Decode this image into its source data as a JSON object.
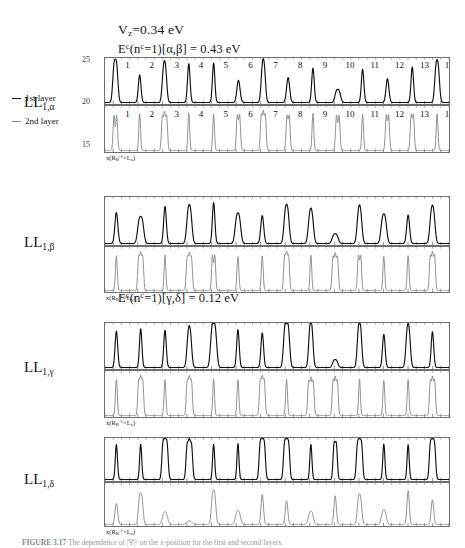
{
  "annotations": {
    "vz": "V_z=0.34 eV",
    "vz_parts": {
      "v": "V",
      "sub": "z",
      "rest": "=0.34 eV"
    },
    "e_alpha_beta": "E^c(n^c=1)[α,β] = 0.43 eV",
    "e_gamma_delta": "E^c(n^c=1)[γ,δ] = 0.12 eV",
    "e_ab_parts": {
      "E": "E",
      "Esup": "c",
      "mid": "(n",
      "nsup": "c",
      "tail": "=1)[α,β] = 0.43 eV"
    },
    "e_gd_parts": {
      "E": "E",
      "Esup": "c",
      "mid": "(n",
      "nsup": "c",
      "tail": "=1)[γ,δ] = 0.12 eV"
    }
  },
  "legend": {
    "first_layer": "1st layer",
    "second_layer": "2nd layer",
    "first_layer_color": "#111111",
    "second_layer_color": "#8d8d8d"
  },
  "outer_axis": {
    "label_top": "25",
    "label_mid": "20",
    "label_bottom": "15"
  },
  "axis_titles": {
    "y": "|ψ|²",
    "y_parts": {
      "base": "|ψ|",
      "sup": "2"
    },
    "x": "x(Rв⁻¹×L₂)",
    "x_parts": {
      "a": "x(R",
      "asub": "B",
      "asup": "-1",
      "b": "×L",
      "bsub": "z",
      "c": ")"
    }
  },
  "groups": [
    {
      "id": "LL1alpha",
      "label": "LL",
      "label_sub": "1,α",
      "top": {
        "layer": "1st layer",
        "color": "#111111",
        "yticks": [
          "0.01",
          "0"
        ],
        "ymax": 0.0155,
        "peak_numbers": [
          "1",
          "2",
          "3",
          "4",
          "5",
          "6",
          "7",
          "8",
          "9",
          "10",
          "11",
          "12",
          "13",
          "14"
        ],
        "peaks": [
          {
            "c": 2.0,
            "h": 0.0128,
            "w": 0.62,
            "split": 2,
            "gap": 0.5
          },
          {
            "c": 6.7,
            "h": 0.01,
            "w": 0.6,
            "split": 1,
            "gap": 0.0
          },
          {
            "c": 11.5,
            "h": 0.0108,
            "w": 0.62,
            "split": 2,
            "gap": 0.42
          },
          {
            "c": 16.2,
            "h": 0.014,
            "w": 0.58,
            "split": 1,
            "gap": 0.0
          },
          {
            "c": 21.0,
            "h": 0.0142,
            "w": 0.56,
            "split": 1,
            "gap": 0.0
          },
          {
            "c": 25.8,
            "h": 0.008,
            "w": 0.72,
            "split": 1,
            "gap": 0.0
          },
          {
            "c": 30.6,
            "h": 0.0112,
            "w": 0.6,
            "split": 2,
            "gap": 0.4
          },
          {
            "c": 35.4,
            "h": 0.009,
            "w": 0.7,
            "split": 1,
            "gap": 0.0
          },
          {
            "c": 40.2,
            "h": 0.0124,
            "w": 0.58,
            "split": 1,
            "gap": 0.0
          },
          {
            "c": 45.0,
            "h": 0.0038,
            "w": 0.7,
            "split": 2,
            "gap": 0.55
          },
          {
            "c": 49.8,
            "h": 0.012,
            "w": 0.58,
            "split": 1,
            "gap": 0.0
          },
          {
            "c": 54.6,
            "h": 0.0086,
            "w": 0.66,
            "split": 1,
            "gap": 0.0
          },
          {
            "c": 59.4,
            "h": 0.0128,
            "w": 0.58,
            "split": 1,
            "gap": 0.0
          },
          {
            "c": 64.2,
            "h": 0.0116,
            "w": 0.62,
            "split": 2,
            "gap": 0.45
          }
        ]
      },
      "bottom": {
        "layer": "2nd layer",
        "color": "#8d8d8d",
        "yticks": [
          "0.1",
          "0"
        ],
        "ymax": 0.125,
        "peak_numbers": [
          "1",
          "2",
          "3",
          "4",
          "5",
          "6",
          "7",
          "8",
          "9",
          "10",
          "11",
          "12",
          "13",
          "14"
        ],
        "peaks": [
          {
            "c": 2.0,
            "h": 0.105,
            "w": 0.42,
            "split": 2,
            "gap": 0.52
          },
          {
            "c": 6.7,
            "h": 0.108,
            "w": 0.4,
            "split": 1,
            "gap": 0.0
          },
          {
            "c": 11.5,
            "h": 0.103,
            "w": 0.42,
            "split": 3,
            "gap": 0.42
          },
          {
            "c": 16.2,
            "h": 0.11,
            "w": 0.4,
            "split": 1,
            "gap": 0.0
          },
          {
            "c": 21.0,
            "h": 0.107,
            "w": 0.4,
            "split": 1,
            "gap": 0.0
          },
          {
            "c": 25.8,
            "h": 0.104,
            "w": 0.42,
            "split": 2,
            "gap": 0.45
          },
          {
            "c": 30.6,
            "h": 0.106,
            "w": 0.4,
            "split": 3,
            "gap": 0.4
          },
          {
            "c": 35.4,
            "h": 0.102,
            "w": 0.42,
            "split": 2,
            "gap": 0.44
          },
          {
            "c": 40.2,
            "h": 0.108,
            "w": 0.4,
            "split": 1,
            "gap": 0.0
          },
          {
            "c": 45.0,
            "h": 0.103,
            "w": 0.44,
            "split": 2,
            "gap": 0.5
          },
          {
            "c": 49.8,
            "h": 0.106,
            "w": 0.4,
            "split": 1,
            "gap": 0.0
          },
          {
            "c": 54.6,
            "h": 0.104,
            "w": 0.42,
            "split": 2,
            "gap": 0.46
          },
          {
            "c": 59.4,
            "h": 0.105,
            "w": 0.42,
            "split": 2,
            "gap": 0.44
          },
          {
            "c": 64.2,
            "h": 0.107,
            "w": 0.4,
            "split": 1,
            "gap": 0.0
          }
        ]
      }
    },
    {
      "id": "LL1beta",
      "label": "LL",
      "label_sub": "1,β",
      "top": {
        "layer": "1st layer",
        "color": "#111111",
        "yticks": [
          "0.02",
          "0.01",
          "0"
        ],
        "ymax": 0.0215,
        "peak_numbers": [],
        "peaks": [
          {
            "c": 2.2,
            "h": 0.0148,
            "w": 0.68,
            "split": 1,
            "gap": 0.0
          },
          {
            "c": 6.9,
            "h": 0.0104,
            "w": 0.76,
            "split": 2,
            "gap": 0.6
          },
          {
            "c": 11.6,
            "h": 0.0178,
            "w": 0.62,
            "split": 1,
            "gap": 0.0
          },
          {
            "c": 16.3,
            "h": 0.0138,
            "w": 0.7,
            "split": 2,
            "gap": 0.5
          },
          {
            "c": 21.0,
            "h": 0.0196,
            "w": 0.58,
            "split": 1,
            "gap": 0.0
          },
          {
            "c": 25.7,
            "h": 0.0112,
            "w": 0.74,
            "split": 2,
            "gap": 0.55
          },
          {
            "c": 30.4,
            "h": 0.0134,
            "w": 0.68,
            "split": 1,
            "gap": 0.0
          },
          {
            "c": 35.1,
            "h": 0.0142,
            "w": 0.68,
            "split": 2,
            "gap": 0.5
          },
          {
            "c": 39.8,
            "h": 0.012,
            "w": 0.72,
            "split": 2,
            "gap": 0.48
          },
          {
            "c": 44.5,
            "h": 0.0036,
            "w": 0.8,
            "split": 2,
            "gap": 0.6
          },
          {
            "c": 49.2,
            "h": 0.013,
            "w": 0.68,
            "split": 2,
            "gap": 0.45
          },
          {
            "c": 53.9,
            "h": 0.0108,
            "w": 0.74,
            "split": 2,
            "gap": 0.55
          },
          {
            "c": 58.6,
            "h": 0.0136,
            "w": 0.66,
            "split": 1,
            "gap": 0.0
          },
          {
            "c": 63.3,
            "h": 0.0132,
            "w": 0.7,
            "split": 2,
            "gap": 0.48
          }
        ]
      },
      "bottom": {
        "layer": "2nd layer",
        "color": "#8d8d8d",
        "yticks": [
          "0.1",
          "0"
        ],
        "ymax": 0.125,
        "peak_numbers": [],
        "peaks": [
          {
            "c": 2.2,
            "h": 0.104,
            "w": 0.42,
            "split": 1,
            "gap": 0.0
          },
          {
            "c": 6.9,
            "h": 0.102,
            "w": 0.42,
            "split": 3,
            "gap": 0.4
          },
          {
            "c": 11.6,
            "h": 0.105,
            "w": 0.4,
            "split": 1,
            "gap": 0.0
          },
          {
            "c": 16.3,
            "h": 0.1,
            "w": 0.44,
            "split": 3,
            "gap": 0.42
          },
          {
            "c": 21.0,
            "h": 0.107,
            "w": 0.4,
            "split": 2,
            "gap": 0.46
          },
          {
            "c": 25.7,
            "h": 0.101,
            "w": 0.44,
            "split": 1,
            "gap": 0.0
          },
          {
            "c": 30.4,
            "h": 0.104,
            "w": 0.42,
            "split": 1,
            "gap": 0.0
          },
          {
            "c": 35.1,
            "h": 0.103,
            "w": 0.42,
            "split": 3,
            "gap": 0.4
          },
          {
            "c": 39.8,
            "h": 0.106,
            "w": 0.4,
            "split": 1,
            "gap": 0.0
          },
          {
            "c": 44.5,
            "h": 0.102,
            "w": 0.44,
            "split": 3,
            "gap": 0.44
          },
          {
            "c": 49.2,
            "h": 0.105,
            "w": 0.42,
            "split": 2,
            "gap": 0.45
          },
          {
            "c": 53.9,
            "h": 0.103,
            "w": 0.42,
            "split": 1,
            "gap": 0.0
          },
          {
            "c": 58.6,
            "h": 0.104,
            "w": 0.42,
            "split": 1,
            "gap": 0.0
          },
          {
            "c": 63.3,
            "h": 0.106,
            "w": 0.42,
            "split": 3,
            "gap": 0.42
          }
        ]
      }
    },
    {
      "id": "LL1gamma",
      "label": "LL",
      "label_sub": "1,γ",
      "top": {
        "layer": "1st layer",
        "color": "#111111",
        "yticks": [
          "0.01",
          "0"
        ],
        "ymax": 0.0168,
        "peak_numbers": [],
        "peaks": [
          {
            "c": 2.2,
            "h": 0.0142,
            "w": 0.6,
            "split": 1,
            "gap": 0.0
          },
          {
            "c": 6.9,
            "h": 0.0152,
            "w": 0.56,
            "split": 1,
            "gap": 0.0
          },
          {
            "c": 11.6,
            "h": 0.0146,
            "w": 0.58,
            "split": 1,
            "gap": 0.0
          },
          {
            "c": 16.3,
            "h": 0.0118,
            "w": 0.64,
            "split": 2,
            "gap": 0.44
          },
          {
            "c": 21.0,
            "h": 0.0112,
            "w": 0.66,
            "split": 3,
            "gap": 0.4
          },
          {
            "c": 25.7,
            "h": 0.0148,
            "w": 0.58,
            "split": 1,
            "gap": 0.0
          },
          {
            "c": 30.4,
            "h": 0.0136,
            "w": 0.6,
            "split": 1,
            "gap": 0.0
          },
          {
            "c": 35.1,
            "h": 0.0122,
            "w": 0.62,
            "split": 3,
            "gap": 0.4
          },
          {
            "c": 39.8,
            "h": 0.0134,
            "w": 0.6,
            "split": 2,
            "gap": 0.42
          },
          {
            "c": 44.5,
            "h": 0.0024,
            "w": 0.7,
            "split": 2,
            "gap": 0.52
          },
          {
            "c": 49.2,
            "h": 0.0136,
            "w": 0.6,
            "split": 2,
            "gap": 0.44
          },
          {
            "c": 53.9,
            "h": 0.013,
            "w": 0.6,
            "split": 1,
            "gap": 0.0
          },
          {
            "c": 58.6,
            "h": 0.0124,
            "w": 0.62,
            "split": 2,
            "gap": 0.42
          },
          {
            "c": 63.3,
            "h": 0.014,
            "w": 0.58,
            "split": 1,
            "gap": 0.0
          }
        ]
      },
      "bottom": {
        "layer": "2nd layer",
        "color": "#8d8d8d",
        "yticks": [
          "0.1",
          "0"
        ],
        "ymax": 0.125,
        "peak_numbers": [],
        "peaks": [
          {
            "c": 2.2,
            "h": 0.105,
            "w": 0.42,
            "split": 1,
            "gap": 0.0
          },
          {
            "c": 6.9,
            "h": 0.103,
            "w": 0.42,
            "split": 3,
            "gap": 0.4
          },
          {
            "c": 11.6,
            "h": 0.104,
            "w": 0.42,
            "split": 1,
            "gap": 0.0
          },
          {
            "c": 16.3,
            "h": 0.102,
            "w": 0.44,
            "split": 3,
            "gap": 0.42
          },
          {
            "c": 21.0,
            "h": 0.106,
            "w": 0.4,
            "split": 1,
            "gap": 0.0
          },
          {
            "c": 25.7,
            "h": 0.104,
            "w": 0.42,
            "split": 1,
            "gap": 0.0
          },
          {
            "c": 30.4,
            "h": 0.103,
            "w": 0.42,
            "split": 3,
            "gap": 0.4
          },
          {
            "c": 35.1,
            "h": 0.105,
            "w": 0.42,
            "split": 1,
            "gap": 0.0
          },
          {
            "c": 39.8,
            "h": 0.102,
            "w": 0.44,
            "split": 3,
            "gap": 0.44
          },
          {
            "c": 44.5,
            "h": 0.104,
            "w": 0.42,
            "split": 3,
            "gap": 0.42
          },
          {
            "c": 49.2,
            "h": 0.106,
            "w": 0.4,
            "split": 1,
            "gap": 0.0
          },
          {
            "c": 53.9,
            "h": 0.103,
            "w": 0.42,
            "split": 1,
            "gap": 0.0
          },
          {
            "c": 58.6,
            "h": 0.105,
            "w": 0.42,
            "split": 1,
            "gap": 0.0
          },
          {
            "c": 63.3,
            "h": 0.104,
            "w": 0.42,
            "split": 3,
            "gap": 0.42
          }
        ]
      }
    },
    {
      "id": "LL1delta",
      "label": "LL",
      "label_sub": "1,δ",
      "top": {
        "layer": "1st layer",
        "color": "#111111",
        "yticks": [
          "0.1",
          "0"
        ],
        "ymax": 0.128,
        "peak_numbers": [],
        "peaks": [
          {
            "c": 2.2,
            "h": 0.112,
            "w": 0.5,
            "split": 1,
            "gap": 0.0
          },
          {
            "c": 6.9,
            "h": 0.114,
            "w": 0.48,
            "split": 1,
            "gap": 0.0
          },
          {
            "c": 11.6,
            "h": 0.11,
            "w": 0.5,
            "split": 3,
            "gap": 0.42
          },
          {
            "c": 16.3,
            "h": 0.109,
            "w": 0.5,
            "split": 3,
            "gap": 0.44
          },
          {
            "c": 21.0,
            "h": 0.113,
            "w": 0.48,
            "split": 1,
            "gap": 0.0
          },
          {
            "c": 25.7,
            "h": 0.115,
            "w": 0.46,
            "split": 1,
            "gap": 0.0
          },
          {
            "c": 30.4,
            "h": 0.111,
            "w": 0.5,
            "split": 3,
            "gap": 0.42
          },
          {
            "c": 35.1,
            "h": 0.11,
            "w": 0.5,
            "split": 3,
            "gap": 0.42
          },
          {
            "c": 39.8,
            "h": 0.113,
            "w": 0.48,
            "split": 1,
            "gap": 0.0
          },
          {
            "c": 44.5,
            "h": 0.112,
            "w": 0.48,
            "split": 2,
            "gap": 0.44
          },
          {
            "c": 49.2,
            "h": 0.109,
            "w": 0.5,
            "split": 3,
            "gap": 0.42
          },
          {
            "c": 53.9,
            "h": 0.114,
            "w": 0.48,
            "split": 1,
            "gap": 0.0
          },
          {
            "c": 58.6,
            "h": 0.112,
            "w": 0.48,
            "split": 1,
            "gap": 0.0
          },
          {
            "c": 63.3,
            "h": 0.11,
            "w": 0.5,
            "split": 3,
            "gap": 0.42
          }
        ]
      },
      "bottom": {
        "layer": "2nd layer",
        "color": "#8d8d8d",
        "yticks": [
          "0.01",
          "0"
        ],
        "ymax": 0.0175,
        "peak_numbers": [],
        "peaks": [
          {
            "c": 2.2,
            "h": 0.0092,
            "w": 0.62,
            "split": 1,
            "gap": 0.0
          },
          {
            "c": 6.9,
            "h": 0.0112,
            "w": 0.58,
            "split": 2,
            "gap": 0.46
          },
          {
            "c": 11.6,
            "h": 0.0042,
            "w": 0.72,
            "split": 2,
            "gap": 0.52
          },
          {
            "c": 16.3,
            "h": 0.0012,
            "w": 0.8,
            "split": 2,
            "gap": 0.6
          },
          {
            "c": 21.0,
            "h": 0.0118,
            "w": 0.58,
            "split": 2,
            "gap": 0.44
          },
          {
            "c": 25.7,
            "h": 0.0046,
            "w": 0.7,
            "split": 2,
            "gap": 0.5
          },
          {
            "c": 30.4,
            "h": 0.0132,
            "w": 0.56,
            "split": 1,
            "gap": 0.0
          },
          {
            "c": 35.1,
            "h": 0.0104,
            "w": 0.58,
            "split": 1,
            "gap": 0.0
          },
          {
            "c": 39.8,
            "h": 0.0044,
            "w": 0.7,
            "split": 2,
            "gap": 0.5
          },
          {
            "c": 44.5,
            "h": 0.0126,
            "w": 0.56,
            "split": 1,
            "gap": 0.0
          },
          {
            "c": 49.2,
            "h": 0.0102,
            "w": 0.6,
            "split": 2,
            "gap": 0.44
          },
          {
            "c": 53.9,
            "h": 0.0048,
            "w": 0.7,
            "split": 2,
            "gap": 0.48
          },
          {
            "c": 58.6,
            "h": 0.0148,
            "w": 0.54,
            "split": 1,
            "gap": 0.0
          },
          {
            "c": 63.3,
            "h": 0.0108,
            "w": 0.58,
            "split": 1,
            "gap": 0.0
          }
        ]
      }
    }
  ],
  "caption": {
    "bold": "FIGURE 3.17",
    "text": "  The dependence of |Ψ|² on the x-position for the first and second layers."
  },
  "xrange": [
    0,
    66.5
  ],
  "xticks_per_peak": 3
}
